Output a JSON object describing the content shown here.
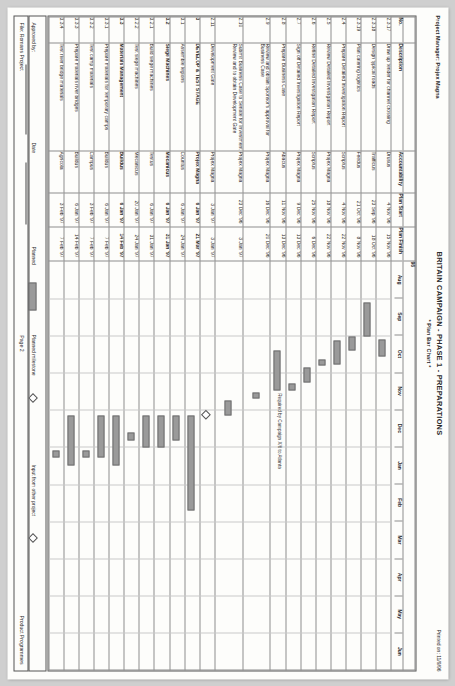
{
  "header": {
    "project_manager": "Project Manager: Projex Magna",
    "title": "BRITAIN CAMPAIGN - PHASE 1 - PREPARATIONS",
    "subtitle": "* Plan Bar Chart *",
    "printed_on": "Printed on: 11/9/96"
  },
  "columns": {
    "no": "No.",
    "description": "Description",
    "accountability": "Accountability",
    "plan_start": "Plan Start",
    "plan_finish": "Plan Finish"
  },
  "timeline": {
    "year_label": "96",
    "months": [
      "Aug",
      "Sep",
      "Oct",
      "Nov",
      "Dec",
      "Jan",
      "Feb",
      "Mar",
      "Apr",
      "May",
      "Jun"
    ],
    "annotation": "Required by Campaign X/6 to Atlanta"
  },
  "rows": [
    {
      "no": "2.3.17",
      "description": "Draw up tender for channel crossing",
      "accountability": "Drusus",
      "start": "4 Nov '96",
      "finish": "15 Nov '96",
      "bold": false,
      "bar": {
        "from": 2.1,
        "to": 2.52
      }
    },
    {
      "no": "2.3.18",
      "description": "Design typical roads",
      "accountability": "Trafficus",
      "start": "23 Sep '96",
      "finish": "18 Oct '96",
      "bold": false,
      "bar": {
        "from": 1.1,
        "to": 1.98
      }
    },
    {
      "no": "2.3.19",
      "description": "Plan catering logistics",
      "accountability": "Feedus",
      "start": "21 Oct '96",
      "finish": "8 Nov '96",
      "bold": false,
      "bar": {
        "from": 2.02,
        "to": 2.34
      }
    },
    {
      "no": "2.4",
      "description": "Prepare Detailed Investigation Report",
      "accountability": "Scriptus",
      "start": "4 Nov '96",
      "finish": "22 Nov '96",
      "bold": false,
      "bar": {
        "from": 2.13,
        "to": 2.72
      }
    },
    {
      "no": "2.5",
      "description": "Review Detailed Investigation Report",
      "accountability": "Projex Magna",
      "start": "18 Nov '96",
      "finish": "22 Nov '96",
      "bold": false,
      "bar": {
        "from": 2.63,
        "to": 2.76
      }
    },
    {
      "no": "2.6",
      "description": "Refine Detailed Investigation Report",
      "accountability": "Scriptus",
      "start": "25 Nov '96",
      "finish": "6 Dec '96",
      "bold": false,
      "bar": {
        "from": 2.85,
        "to": 3.22
      }
    },
    {
      "no": "2.7",
      "description": "Sign off Detailed Investigation Report",
      "accountability": "Projex Magna",
      "start": "9 Dec '96",
      "finish": "13 Dec '96",
      "bold": false,
      "bar": {
        "from": 3.29,
        "to": 3.42
      }
    },
    {
      "no": "2.8",
      "description": "Prepare Business Case",
      "accountability": "Abacus",
      "start": "11 Nov '96",
      "finish": "13 Dec '96",
      "bold": false,
      "bar": {
        "from": 2.4,
        "to": 3.42
      }
    },
    {
      "no": "2.9",
      "description": "Review and obtain Sponsor's approval for Business Case",
      "accountability": "Projex Magna",
      "start": "16 Dec '96",
      "finish": "20 Dec '96",
      "bold": false,
      "bar": {
        "from": 3.52,
        "to": 3.65
      }
    },
    {
      "no": "2.10",
      "description": "Submit Business Case to Senate for Investment Review and to obtain Development Gate",
      "accountability": "Projex Magna",
      "start": "23 Dec '96",
      "finish": "3 Jan '97",
      "bold": false,
      "bar": {
        "from": 3.74,
        "to": 4.1
      }
    },
    {
      "no": "2.11",
      "description": "Development Gate",
      "accountability": "Projex Magna",
      "start": "3 Jan '97",
      "finish": "3 Jan '97",
      "bold": false,
      "milestone": 4.1
    },
    {
      "no": "3",
      "description": "DEVELOP & TEST STAGE",
      "accountability": "Projex Magna",
      "start": "6 Jan '97",
      "finish": "21 Mar '97",
      "bold": true,
      "bar": {
        "from": 4.16,
        "to": 6.65
      }
    },
    {
      "no": "3.1",
      "description": "Assemble legions",
      "accountability": "Countus",
      "start": "6 Jan '97",
      "finish": "24 Jan '97",
      "bold": false,
      "bar": {
        "from": 4.16,
        "to": 4.77
      }
    },
    {
      "no": "3.2",
      "description": "Siege Machines",
      "accountability": "Mecanicus",
      "start": "6 Jan '97",
      "finish": "31 Jan '97",
      "bold": true,
      "bar": {
        "from": 4.16,
        "to": 4.97
      }
    },
    {
      "no": "3.2.1",
      "description": "Build siege machines",
      "accountability": "Testus",
      "start": "6 Jan '97",
      "finish": "31 Jan '97",
      "bold": false,
      "bar": {
        "from": 4.16,
        "to": 4.97
      }
    },
    {
      "no": "3.2.2",
      "description": "Test siege machines",
      "accountability": "Mecanicus",
      "start": "20 Jan '97",
      "finish": "24 Jan '97",
      "bold": false,
      "bar": {
        "from": 4.61,
        "to": 4.77
      }
    },
    {
      "no": "3.3",
      "description": "Materials Management",
      "accountability": "Buildus",
      "start": "6 Jan '97",
      "finish": "14 Feb '97",
      "bold": true,
      "bar": {
        "from": 4.16,
        "to": 5.45
      }
    },
    {
      "no": "3.3.1",
      "description": "Prepare materials for temporary camps",
      "accountability": "Buildus",
      "start": "6 Jan '97",
      "finish": "7 Feb '97",
      "bold": false,
      "bar": {
        "from": 4.16,
        "to": 5.22
      }
    },
    {
      "no": "3.3.2",
      "description": "Test camp materials",
      "accountability": "Campus",
      "start": "3 Feb '97",
      "finish": "7 Feb '97",
      "bold": false,
      "bar": {
        "from": 5.09,
        "to": 5.22
      }
    },
    {
      "no": "3.3.3",
      "description": "Prepare materials river bridges",
      "accountability": "Buildus",
      "start": "6 Jan '97",
      "finish": "14 Feb '97",
      "bold": false,
      "bar": {
        "from": 4.16,
        "to": 5.45
      }
    },
    {
      "no": "3.3.4",
      "description": "Test river bridge materials",
      "accountability": "Agricola",
      "start": "3 Feb '97",
      "finish": "7 Feb '97",
      "bold": false,
      "bar": {
        "from": 5.09,
        "to": 5.22
      }
    }
  ],
  "legend": {
    "approved_by": "Approved by:",
    "date": "Date",
    "planned": "Planned",
    "planned_milestone": "Planned milestone",
    "input_from_other_project": "Input from other project"
  },
  "footer": {
    "file": "File: Romans Project",
    "page": "Page 2",
    "product": "Product Programmes"
  }
}
